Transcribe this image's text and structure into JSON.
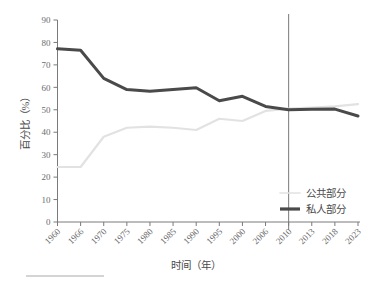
{
  "chart_data": {
    "type": "line",
    "title": "",
    "xlabel": "时间（年）",
    "ylabel": "百分比（%）",
    "categories": [
      "1960",
      "1966",
      "1970",
      "1975",
      "1980",
      "1985",
      "1990",
      "1995",
      "2000",
      "2006",
      "2010",
      "2013",
      "2018",
      "2023"
    ],
    "series": [
      {
        "name": "公共部分",
        "color": "#e2e2e2",
        "values": [
          24.5,
          24.5,
          38.0,
          42.0,
          42.5,
          42.0,
          41.0,
          46.0,
          45.0,
          49.5,
          50.5,
          51.0,
          51.5,
          52.5
        ]
      },
      {
        "name": "私人部分",
        "color": "#4a4a4a",
        "values": [
          77.2,
          76.5,
          64.0,
          59.0,
          58.3,
          59.0,
          59.8,
          54.0,
          56.0,
          51.5,
          50.0,
          50.2,
          50.3,
          47.2
        ]
      }
    ],
    "ylim": [
      0,
      90
    ],
    "yticks": [
      0,
      10,
      20,
      30,
      40,
      50,
      60,
      70,
      80,
      90
    ],
    "grid": false,
    "legend_position": "bottom-right",
    "annotations": [
      {
        "type": "vertical-reference-line",
        "at_category": "2010",
        "color": "#555555"
      }
    ]
  },
  "legend": {
    "items": [
      {
        "label": "公共部分",
        "color": "#e2e2e2",
        "thickness": 1.6
      },
      {
        "label": "私人部分",
        "color": "#4a4a4a",
        "thickness": 3.2
      }
    ]
  },
  "footnote": {
    "rule_visible": true
  }
}
